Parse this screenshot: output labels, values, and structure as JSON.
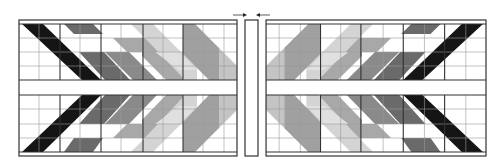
{
  "diagram": {
    "type": "quilt-layout",
    "colors": {
      "background": "#ffffff",
      "line": "#333333",
      "grid": "#9a9a9a",
      "black": "#151515",
      "dark": "#6a6a6a",
      "mid": "#9c9c9c",
      "light": "#c4c4c4",
      "pale": "#dedede"
    },
    "arrows": [
      {
        "direction": "right",
        "x": 240,
        "y": 15
      },
      {
        "direction": "left",
        "x": 262,
        "y": 15
      }
    ],
    "panels": [
      {
        "name": "left-panel",
        "x": 19,
        "y": 20,
        "width": 218,
        "height": 136
      },
      {
        "name": "right-panel",
        "x": 266,
        "y": 20,
        "width": 220,
        "height": 136
      }
    ],
    "center_strip": {
      "x": 245,
      "y": 20,
      "width": 13,
      "height": 136
    }
  }
}
